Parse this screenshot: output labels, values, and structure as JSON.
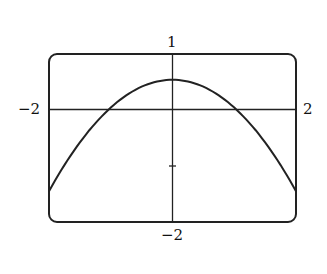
{
  "chart_data": {
    "type": "line",
    "title": "",
    "xlabel": "",
    "ylabel": "",
    "xlim": [
      -2,
      2
    ],
    "ylim": [
      -2,
      1
    ],
    "grid": false,
    "legend": null,
    "tick_labels": {
      "x_min": "−2",
      "x_max": "2",
      "y_min": "−2",
      "y_max": "1"
    },
    "y_ticks": [
      -1
    ],
    "series": [
      {
        "name": "curve",
        "x": [
          -2,
          -1.5,
          -1,
          -0.5,
          0,
          0.5,
          1,
          1.5,
          2
        ],
        "values": [
          -1.45,
          -0.6,
          0.0,
          0.4,
          0.54,
          0.4,
          0.0,
          -0.6,
          -1.45
        ]
      }
    ]
  }
}
